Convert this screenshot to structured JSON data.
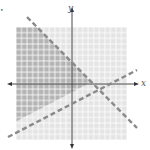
{
  "figure": {
    "marker": "•",
    "x_axis_label": "x",
    "y_axis_label": "y",
    "type": "system-of-linear-inequalities",
    "grid": {
      "left": 16,
      "top": 27,
      "right": 127,
      "bottom": 140,
      "cell_size": 5.55,
      "light_fill": "#e4e4e4",
      "dark_fill": "#b4b4b4",
      "grid_line": "#ffffff"
    },
    "axes": {
      "origin_x": 72,
      "origin_y": 84,
      "x_start": 8,
      "x_end": 138,
      "y_start": 7,
      "y_end": 148,
      "color": "#333333"
    },
    "boundary_lines": [
      {
        "name": "decreasing-line",
        "style": "dashed",
        "x1": 27,
        "y1": 17,
        "x2": 137,
        "y2": 128,
        "color": "#8a8a8a"
      },
      {
        "name": "increasing-line",
        "style": "dashed",
        "x1": 8,
        "y1": 137,
        "x2": 137,
        "y2": 70,
        "color": "#8a8a8a"
      }
    ],
    "shaded_region": "above increasing line and below decreasing line"
  }
}
